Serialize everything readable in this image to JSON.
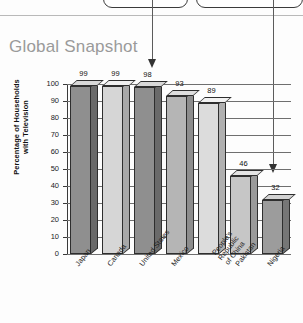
{
  "callouts": [
    {
      "name": "callout-left"
    },
    {
      "name": "callout-right"
    }
  ],
  "chart_title": "Global Snapshot",
  "chart_data": {
    "type": "bar",
    "title": "Global Snapshot",
    "xlabel": "",
    "ylabel": "Percentage of Households with Television",
    "ylabel_line1": "Percentage of Households",
    "ylabel_line2": "with Television",
    "ylim": [
      0,
      100
    ],
    "ytick_step": 10,
    "grid": true,
    "legend": "none",
    "categories": [
      "Japan",
      "Canada",
      "United States",
      "Mexico",
      "People's Republic of China",
      "Pakistan",
      "Nigeria"
    ],
    "category_lines": [
      [
        "Japan"
      ],
      [
        "Canada"
      ],
      [
        "United States"
      ],
      [
        "Mexico"
      ],
      [
        "People's Republic",
        "of China"
      ],
      [
        "Pakistan"
      ],
      [
        "Nigeria"
      ]
    ],
    "values": [
      99,
      99,
      98,
      93,
      89,
      46,
      32
    ],
    "tick_labels": [
      "100",
      "90",
      "80",
      "70",
      "60",
      "50",
      "40",
      "30",
      "20",
      "10",
      "0"
    ],
    "bar_colors": [
      "#8f8f8f",
      "#d6d6d6",
      "#8f8f8f",
      "#b5b5b5",
      "#dcdcdc",
      "#c6c6c6",
      "#9c9c9c"
    ],
    "bar_top_colors": [
      "#d8d8d8",
      "#f0f0f0",
      "#d8d8d8",
      "#dedede",
      "#f2f2f2",
      "#e4e4e4",
      "#d2d2d2"
    ],
    "bar_side_colors": [
      "#6a6a6a",
      "#a8a8a8",
      "#6a6a6a",
      "#8d8d8d",
      "#b0b0b0",
      "#9a9a9a",
      "#767676"
    ]
  },
  "annotations": {
    "arrow_a_target": "United States bar (98)",
    "arrow_b_target": "Pakistan bar (46)"
  },
  "colors": {
    "title": "#9a9a9a",
    "axis": "#3a3a3a",
    "grid": "#6f6f6f",
    "connector": "#5c5c5c",
    "callout_border": "#3b3b3b"
  }
}
